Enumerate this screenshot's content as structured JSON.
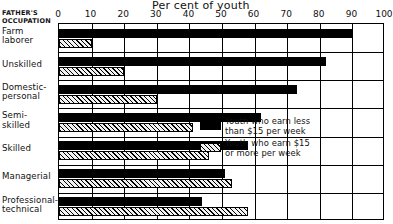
{
  "chart_data": {
    "type": "bar",
    "orientation": "horizontal",
    "title": "Per cent of youth",
    "xlabel": "Per cent of youth",
    "ylabel": "FATHER'S OCCUPATION",
    "xlim": [
      0,
      100
    ],
    "xticks": [
      0,
      10,
      20,
      30,
      40,
      50,
      60,
      70,
      80,
      90,
      100
    ],
    "xtick_labels": [
      "0",
      "10",
      "20",
      "30",
      "40",
      "50",
      "60",
      "70",
      "80",
      "90",
      "100"
    ],
    "grid": "vertical",
    "legend_position": "inside-right",
    "categories": [
      "Farm laborer",
      "Unskilled",
      "Domestic-personal",
      "Semi-skilled",
      "Skilled",
      "Managerial",
      "Professional-technical"
    ],
    "series": [
      {
        "name": "Youth who earn less than $15 per week",
        "style": "solid-black",
        "color": "#000000",
        "values": [
          90,
          82,
          73,
          62,
          58,
          51,
          44
        ]
      },
      {
        "name": "Youth who earn $15 or more per week",
        "style": "diagonal-hatch",
        "color": "#f2f2f2",
        "values": [
          10,
          20,
          30,
          41,
          46,
          53,
          58
        ]
      }
    ]
  },
  "header": {
    "corner_line1": "FATHER'S",
    "corner_line2": "OCCUPATION"
  },
  "legend": {
    "items": [
      {
        "swatch": "solid-black",
        "line1": "Youth who earn less",
        "line2": "than $15 per week"
      },
      {
        "swatch": "diagonal-hatch",
        "line1": "Youth who earn $15",
        "line2": "or more per week"
      }
    ]
  }
}
